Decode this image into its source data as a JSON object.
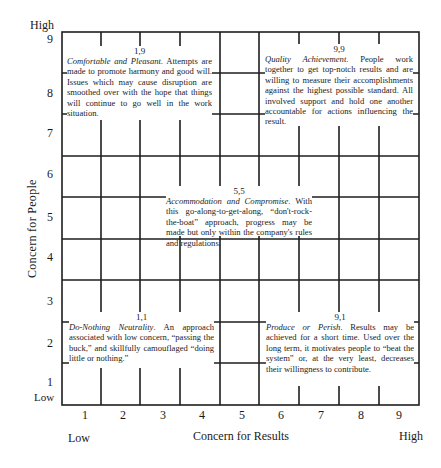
{
  "diagram": {
    "type": "managerial-grid",
    "y_axis": {
      "title": "Concern for People",
      "low_label": "Low",
      "high_label": "High",
      "ticks": [
        "1",
        "2",
        "3",
        "4",
        "5",
        "6",
        "7",
        "8",
        "9"
      ]
    },
    "x_axis": {
      "title": "Concern for Results",
      "low_label": "Low",
      "high_label": "High",
      "ticks": [
        "1",
        "2",
        "3",
        "4",
        "5",
        "6",
        "7",
        "8",
        "9"
      ]
    },
    "styles": [
      {
        "code": "1,9",
        "title": "Comfortable and Pleasant",
        "text": ". Attempts are made to promote harmony and good will. Issues which may cause disruption are smoothed over with the hope that things will continue to go well in the work situation."
      },
      {
        "code": "9,9",
        "title": "Quality Achievement",
        "text": ". People work together to get top-notch results and are willing to measure their accomplishments against the highest possible standard. All involved support and hold one another accountable for actions influencing the result."
      },
      {
        "code": "5,5",
        "title": "Accommodation and Compromise",
        "text": ". With this go-along-to-get-along, “don't-rock-the-boat” approach, progress may be made but only within the company's rules and regulations."
      },
      {
        "code": "1,1",
        "title": "Do-Nothing Neutrality",
        "text": ". An approach associated with low concern, “passing the buck,” and skillfully camouflaged “doing little or nothing.”"
      },
      {
        "code": "9,1",
        "title": "Produce or Perish",
        "text": ". Results may be achieved for a short time. Used over the long term, it motivates people to “beat the system” or, at the very least, decreases their willingness to contribute."
      }
    ],
    "colors": {
      "line": "#1a1a1a",
      "background": "#ffffff"
    }
  }
}
